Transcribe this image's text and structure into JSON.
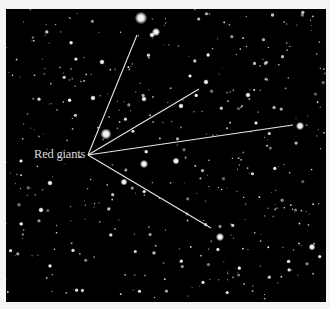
{
  "figure": {
    "label": "Red giants",
    "background_color": "#000000",
    "line_color": "#e6e6e6",
    "pointer_origin": [
      82,
      146
    ],
    "pointer_targets": [
      [
        131,
        26
      ],
      [
        193,
        80
      ],
      [
        287,
        116
      ],
      [
        205,
        219
      ]
    ],
    "bright_stars": [
      [
        135,
        9,
        4.5
      ],
      [
        150,
        23,
        3
      ],
      [
        146,
        26,
        2
      ],
      [
        100,
        125,
        4
      ],
      [
        138,
        155,
        3
      ],
      [
        118,
        173,
        2.5
      ],
      [
        214,
        228,
        3
      ],
      [
        306,
        238,
        2.5
      ],
      [
        294,
        117,
        3
      ],
      [
        200,
        73,
        2
      ],
      [
        87,
        89,
        2
      ],
      [
        170,
        152,
        2.5
      ],
      [
        175,
        97,
        2
      ],
      [
        138,
        90,
        2
      ],
      [
        242,
        86,
        2
      ],
      [
        35,
        201,
        2
      ],
      [
        44,
        174,
        2
      ],
      [
        96,
        53,
        2
      ],
      [
        15,
        152,
        1.5
      ],
      [
        184,
        67,
        1.5
      ],
      [
        250,
        114,
        1.5
      ]
    ]
  }
}
